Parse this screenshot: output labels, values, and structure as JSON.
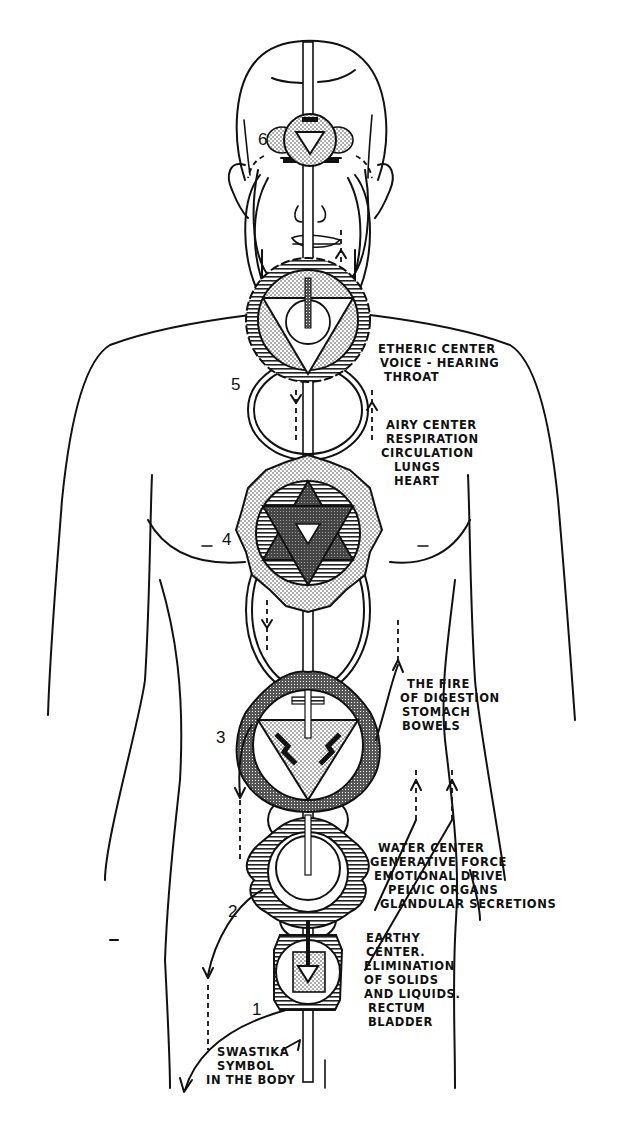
{
  "diagram": {
    "colors": {
      "ink": "#111111",
      "paper": "#ffffff"
    },
    "centers": [
      {
        "number": "6",
        "name": "brow-center",
        "shape": "downward-triangle-in-circle",
        "label_lines": []
      },
      {
        "number": "5",
        "name": "throat-center",
        "shape": "downward-triangle-with-circle, 16-petal lotus",
        "label_lines": [
          "ETHERIC CENTER",
          "VOICE - HEARING",
          "THROAT"
        ]
      },
      {
        "number": "4",
        "name": "heart-center",
        "shape": "six-pointed star, 12-petal lotus",
        "label_lines": [
          "AIRY CENTER",
          "RESPIRATION",
          "CIRCULATION",
          "LUNGS",
          "HEART"
        ]
      },
      {
        "number": "3",
        "name": "navel-center",
        "shape": "downward-triangle with swastika marks, 10-petal lotus",
        "label_lines": [
          "THE FIRE",
          "OF DIGESTION",
          "STOMACH",
          "BOWELS"
        ]
      },
      {
        "number": "2",
        "name": "sacral-center",
        "shape": "circle with crescent, 6-petal lotus",
        "label_lines": [
          "WATER CENTER",
          "GENERATIVE FORCE",
          "EMOTIONAL DRIVE",
          "PELVIC ORGANS",
          "GLANDULAR SECRETIONS"
        ]
      },
      {
        "number": "1",
        "name": "root-center",
        "shape": "square with downward arrow, 4-petal lotus",
        "label_lines": [
          "EARTHY",
          "CENTER.",
          "ELIMINATION",
          "OF SOLIDS",
          "AND LIQUIDS.",
          "RECTUM",
          "BLADDER"
        ]
      }
    ],
    "footnote_lines": [
      "SWASTIKA",
      "SYMBOL",
      "IN THE BODY"
    ]
  }
}
